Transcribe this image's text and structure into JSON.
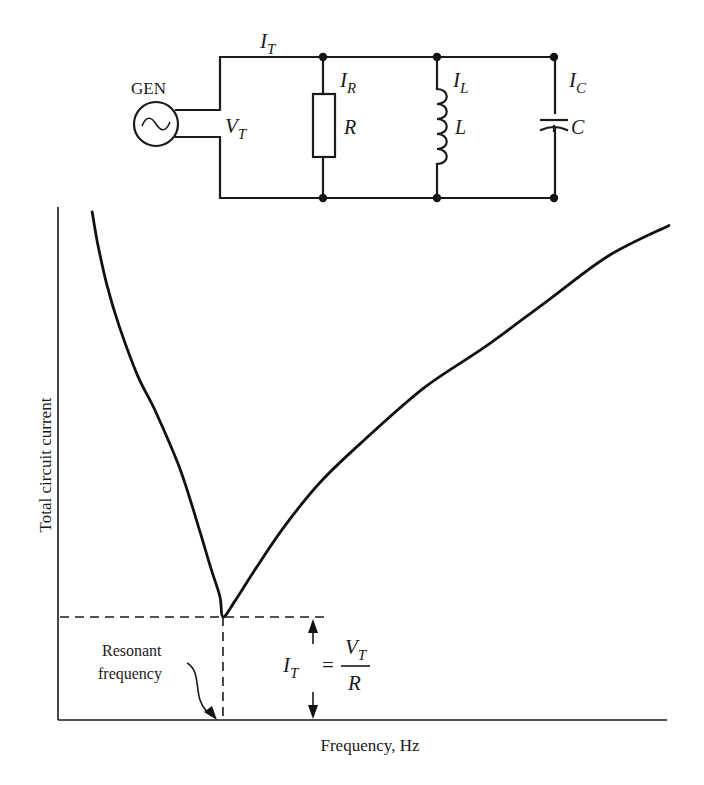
{
  "circuit": {
    "generator_label": "GEN",
    "generator_symbol": "sine-wave",
    "total_current": {
      "main": "I",
      "sub": "T"
    },
    "total_voltage": {
      "main": "V",
      "sub": "T"
    },
    "branches": [
      {
        "current": {
          "main": "I",
          "sub": "R"
        },
        "component": "R",
        "type": "resistor"
      },
      {
        "current": {
          "main": "I",
          "sub": "L"
        },
        "component": "L",
        "type": "inductor"
      },
      {
        "current": {
          "main": "I",
          "sub": "C"
        },
        "component": "C",
        "type": "capacitor"
      }
    ]
  },
  "chart_data": {
    "type": "line",
    "title": "",
    "xlabel": "Frequency, Hz",
    "ylabel": "Total circuit current",
    "xlim": [
      0,
      100
    ],
    "ylim": [
      0,
      100
    ],
    "grid": false,
    "legend": "none",
    "series": [
      {
        "name": "Total circuit current",
        "x": [
          5.6,
          6.5,
          8,
          10,
          13,
          16,
          20,
          23,
          25,
          26.5,
          27,
          29,
          32,
          37,
          43,
          50,
          60,
          70,
          80,
          90,
          100
        ],
        "y": [
          98.8,
          91,
          81,
          71,
          59,
          50,
          36,
          22,
          12,
          5,
          0,
          4,
          11,
          22,
          33,
          43,
          56,
          66,
          77,
          88,
          95.5
        ]
      }
    ],
    "resonance": {
      "x": 27,
      "y": 0,
      "label_line1": "Resonant",
      "label_line2": "frequency",
      "min_current_formula": {
        "lhs": {
          "main": "I",
          "sub": "T"
        },
        "equals": "=",
        "numerator": {
          "main": "V",
          "sub": "T"
        },
        "denominator": "R"
      }
    }
  }
}
